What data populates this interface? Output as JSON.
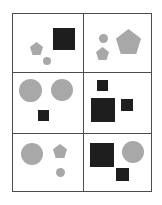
{
  "figure": {
    "type": "shape-grid",
    "width": 162,
    "height": 205,
    "background_color": "#ffffff",
    "border_color": "#4c4c4c",
    "rows": 3,
    "columns": 2,
    "grid": {
      "left": 12,
      "top": 13,
      "width": 140,
      "height": 179,
      "column_divider_x": [
        70
      ],
      "row_divider_y": [
        58,
        119
      ]
    },
    "palette": {
      "gray": "#a8a8a8",
      "dark": "#1e1e1e",
      "panel": "#ffffff",
      "line": "#4c4c4c"
    },
    "cells": [
      {
        "id": "cell-top-left",
        "row": 1,
        "column": 1,
        "shape_count": 3,
        "shapes": [
          {
            "name": "pentagon",
            "color": "#a8a8a8",
            "x": 17,
            "y": 28,
            "size": 13
          },
          {
            "name": "circle",
            "color": "#a8a8a8",
            "x": 30,
            "y": 43,
            "size": 8
          },
          {
            "name": "square",
            "color": "#1e1e1e",
            "x": 40,
            "y": 14,
            "size": 22
          }
        ]
      },
      {
        "id": "cell-top-right",
        "row": 1,
        "column": 2,
        "shape_count": 3,
        "shapes": [
          {
            "name": "circle",
            "color": "#a8a8a8",
            "x": 16,
            "y": 20,
            "size": 9
          },
          {
            "name": "pentagon",
            "color": "#a8a8a8",
            "x": 13,
            "y": 33,
            "size": 13
          },
          {
            "name": "pentagon",
            "color": "#a8a8a8",
            "x": 33,
            "y": 15,
            "size": 25
          }
        ]
      },
      {
        "id": "cell-middle-left",
        "row": 2,
        "column": 1,
        "shape_count": 3,
        "shapes": [
          {
            "name": "circle",
            "color": "#a8a8a8",
            "x": 6,
            "y": 7,
            "size": 23
          },
          {
            "name": "circle",
            "color": "#a8a8a8",
            "x": 38,
            "y": 7,
            "size": 22
          },
          {
            "name": "square",
            "color": "#1e1e1e",
            "x": 25,
            "y": 38,
            "size": 11
          }
        ]
      },
      {
        "id": "cell-middle-right",
        "row": 2,
        "column": 2,
        "shape_count": 3,
        "shapes": [
          {
            "name": "square",
            "color": "#1e1e1e",
            "x": 14,
            "y": 8,
            "size": 11
          },
          {
            "name": "square",
            "color": "#1e1e1e",
            "x": 8,
            "y": 26,
            "size": 24
          },
          {
            "name": "square",
            "color": "#1e1e1e",
            "x": 38,
            "y": 27,
            "size": 12
          }
        ]
      },
      {
        "id": "cell-bottom-left",
        "row": 3,
        "column": 1,
        "shape_count": 3,
        "shapes": [
          {
            "name": "circle",
            "color": "#a8a8a8",
            "x": 8,
            "y": 10,
            "size": 22
          },
          {
            "name": "pentagon",
            "color": "#a8a8a8",
            "x": 40,
            "y": 11,
            "size": 14
          },
          {
            "name": "circle",
            "color": "#a8a8a8",
            "x": 43,
            "y": 35,
            "size": 9
          }
        ]
      },
      {
        "id": "cell-bottom-right",
        "row": 3,
        "column": 2,
        "shape_count": 3,
        "shapes": [
          {
            "name": "square",
            "color": "#1e1e1e",
            "x": 7,
            "y": 10,
            "size": 24
          },
          {
            "name": "circle",
            "color": "#a8a8a8",
            "x": 39,
            "y": 8,
            "size": 22
          },
          {
            "name": "square",
            "color": "#1e1e1e",
            "x": 33,
            "y": 35,
            "size": 13
          }
        ]
      }
    ]
  }
}
